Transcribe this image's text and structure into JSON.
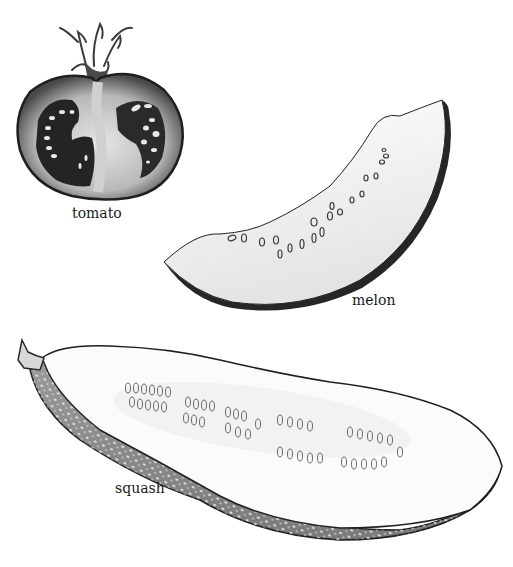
{
  "illustration": {
    "style": "grayscale pencil botanical illustration",
    "background": "#ffffff",
    "items": [
      {
        "id": "tomato",
        "label": "tomato",
        "description": "cross-section of a tomato with stem and seed cavities"
      },
      {
        "id": "melon",
        "label": "melon",
        "description": "crescent slice of melon with seeds"
      },
      {
        "id": "squash",
        "label": "squash",
        "description": "halved squash showing rows of seeds"
      }
    ]
  },
  "colors": {
    "outline": "#1f1f1f",
    "tomato_skin": "#5a5a5a",
    "tomato_flesh": "#bdbdbd",
    "tomato_cavity": "#2a2a2a",
    "melon_flesh": "#f4f4f4",
    "melon_rind": "#2b2b2b",
    "squash_flesh": "#fbfbfb",
    "squash_skin": "#8c8c8c"
  }
}
